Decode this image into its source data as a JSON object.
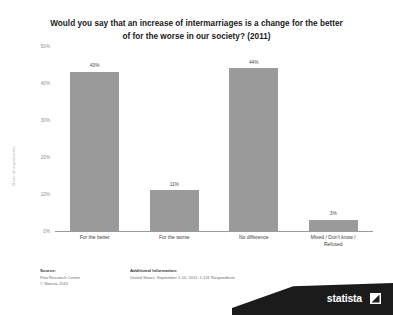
{
  "chart_data": {
    "type": "bar",
    "title": "Would you say that an increase of intermarriages is a change for the better of for the worse in our society? (2011)",
    "title_lines": [
      "Would you say that an increase of intermarriages is a change for the better",
      "of for the worse in our society? (2011)"
    ],
    "categories": [
      "For the better",
      "For the worse",
      "No difference",
      "Mixed / Don't know / Refused"
    ],
    "category_lines": [
      [
        "For the better"
      ],
      [
        "For the worse"
      ],
      [
        "No difference"
      ],
      [
        "Mixed / Don't know /",
        "Refused"
      ]
    ],
    "values": [
      43,
      11,
      44,
      3
    ],
    "value_labels": [
      "43%",
      "11%",
      "44%",
      "3%"
    ],
    "xlabel": "",
    "ylabel": "Share of respondents",
    "ylim": [
      0,
      50
    ],
    "yticks": [
      0,
      10,
      20,
      30,
      40,
      50
    ],
    "ytick_labels": [
      "0%",
      "10%",
      "20%",
      "30%",
      "40%",
      "50%"
    ],
    "grid": false,
    "legend": false,
    "bar_color": "#9a9a9a"
  },
  "footer": {
    "source_heading": "Source:",
    "source_lines": [
      "Pew Research Center",
      "© Statista 2015"
    ],
    "addinfo_heading": "Additional Information:",
    "addinfo_lines": [
      "United States; September 1-10, 2011; 1,131 Respondents"
    ],
    "brand": "statista"
  }
}
